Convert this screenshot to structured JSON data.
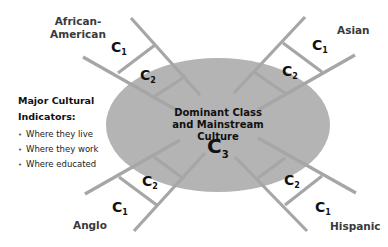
{
  "colors": {
    "ellipse_fill": "#b4b4b4",
    "ladder": "#a6a6a6",
    "text": "#111111",
    "group_label": "#3a3a3a"
  },
  "center": {
    "title_line1": "Dominant Class",
    "title_line2": "and Mainstream Culture",
    "c3_letter": "C",
    "c3_sub": "3"
  },
  "groups": [
    {
      "id": "african-american",
      "line1": "African-",
      "line2": "American",
      "c1": "C",
      "c1_sub": "1",
      "c2": "C",
      "c2_sub": "2"
    },
    {
      "id": "asian",
      "line1": "Asian",
      "line2": "",
      "c1": "C",
      "c1_sub": "1",
      "c2": "C",
      "c2_sub": "2"
    },
    {
      "id": "anglo",
      "line1": "Anglo",
      "line2": "",
      "c1": "C",
      "c1_sub": "1",
      "c2": "C",
      "c2_sub": "2"
    },
    {
      "id": "hispanic",
      "line1": "Hispanic",
      "line2": "",
      "c1": "C",
      "c1_sub": "1",
      "c2": "C",
      "c2_sub": "2"
    }
  ],
  "indicators": {
    "title_line1": "Major Cultural",
    "title_line2": "Indicators:",
    "bullet": "•",
    "items": [
      "Where they live",
      "Where they work",
      "Where educated"
    ]
  }
}
